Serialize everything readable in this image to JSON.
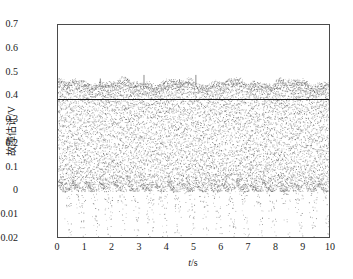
{
  "chart_data": {
    "type": "line",
    "title": "",
    "xlabel": "t/s",
    "ylabel": "故障估计/V",
    "xlim": [
      0,
      10
    ],
    "grid": false,
    "legend": "none",
    "xticks": [
      "0",
      "1",
      "2",
      "3",
      "4",
      "5",
      "6",
      "7",
      "8",
      "9",
      "10"
    ],
    "xtick_values": [
      0,
      1,
      2,
      3,
      4,
      5,
      6,
      7,
      8,
      9,
      10
    ],
    "ytick_labels": [
      "0.7",
      "0.6",
      "0.5",
      "0.4",
      "0.3",
      "0.2",
      "0.1",
      "0",
      "-0.01",
      "-0.02"
    ],
    "ytick_positions": [
      0,
      1,
      2,
      3,
      4,
      5,
      6,
      7,
      8,
      9
    ],
    "series": [
      {
        "name": "fault-estimate",
        "style": "dotted",
        "color": "#555555",
        "description": "dense high-frequency oscillation filling the band between the scalloped lower envelope and the upper envelope",
        "upper_envelope_level": 0.46,
        "lower_envelope_level": -0.025,
        "oscillation_cycles": 20,
        "spike_peaks": [
          {
            "t": 3.15,
            "value": 0.49
          },
          {
            "t": 5.05,
            "value": 0.49
          },
          {
            "t": 1.55,
            "value": 0.475
          },
          {
            "t": 4.45,
            "value": 0.472
          },
          {
            "t": 6.35,
            "value": 0.47
          },
          {
            "t": 8.25,
            "value": 0.47
          }
        ]
      },
      {
        "name": "reference-line",
        "style": "solid",
        "color": "#1a1a1a",
        "value": 0.39,
        "description": "horizontal solid reference line across the full width"
      }
    ]
  }
}
